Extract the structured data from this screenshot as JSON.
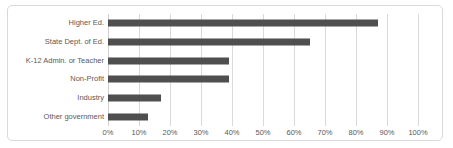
{
  "chart_data": {
    "type": "bar",
    "orientation": "horizontal",
    "title": "",
    "categories": [
      "Higher Ed.",
      "State Dept. of Ed.",
      "K-12 Admin. or Teacher",
      "Non-Profit",
      "Industry",
      "Other government"
    ],
    "values": [
      87,
      65,
      39,
      39,
      17,
      13
    ],
    "value_suffix": "%",
    "xlabel": "",
    "ylabel": "",
    "xlim": [
      0,
      100
    ],
    "x_tick_labels": [
      "0%",
      "10%",
      "20%",
      "30%",
      "40%",
      "50%",
      "60%",
      "70%",
      "80%",
      "90%",
      "100%"
    ],
    "x_tick_values": [
      0,
      10,
      20,
      30,
      40,
      50,
      60,
      70,
      80,
      90,
      100
    ],
    "grid": "vertical",
    "legend_position": "none",
    "colors": {
      "bar": "#4f4f4f",
      "gridline": "#d9d9d9",
      "zero_axis": "#d0d0d0",
      "text": "#595959",
      "frame_border": "#d9d9d9",
      "background": "#ffffff"
    }
  }
}
